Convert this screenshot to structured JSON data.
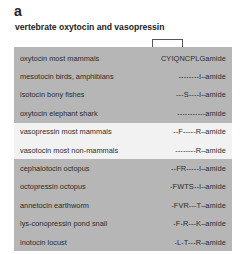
{
  "figure": {
    "panel_letter": "a",
    "title": "vertebrate oxytocin and vasopressin"
  },
  "colors": {
    "dark_band": "#b6b6b6",
    "light_band": "#f2f2f2",
    "text": "#2b2b2b"
  },
  "groups": [
    {
      "shade": "dark",
      "rows": [
        {
          "name": "oxytocin most mammals",
          "sequence": "CYIQNCPLGamide"
        },
        {
          "name": "mesotocin birds, amphibians",
          "sequence": "--------I–amide"
        },
        {
          "name": "isotocin bony fishes",
          "sequence": "---S----I–amide"
        },
        {
          "name": "oxytocin elephant shark",
          "sequence": "-----------amide"
        }
      ]
    },
    {
      "shade": "light",
      "rows": [
        {
          "name": "vasopressin most mammals",
          "sequence": "--F-----R–amide"
        },
        {
          "name": "vasotocin most non-mammals",
          "sequence": "--------R–amide"
        }
      ]
    },
    {
      "shade": "dark",
      "rows": [
        {
          "name": "cephalotocin octopus",
          "sequence": "--FR-----I–amide"
        },
        {
          "name": "octopressin octopus",
          "sequence": "-FWTS--I–amide"
        },
        {
          "name": "annetocin earthworm",
          "sequence": "-FVR---T–amide"
        },
        {
          "name": "lys-conopressin pond snail",
          "sequence": "-F-R---K–amide"
        },
        {
          "name": "inotocin locust",
          "sequence": "-L-T---R–amide"
        }
      ]
    }
  ]
}
